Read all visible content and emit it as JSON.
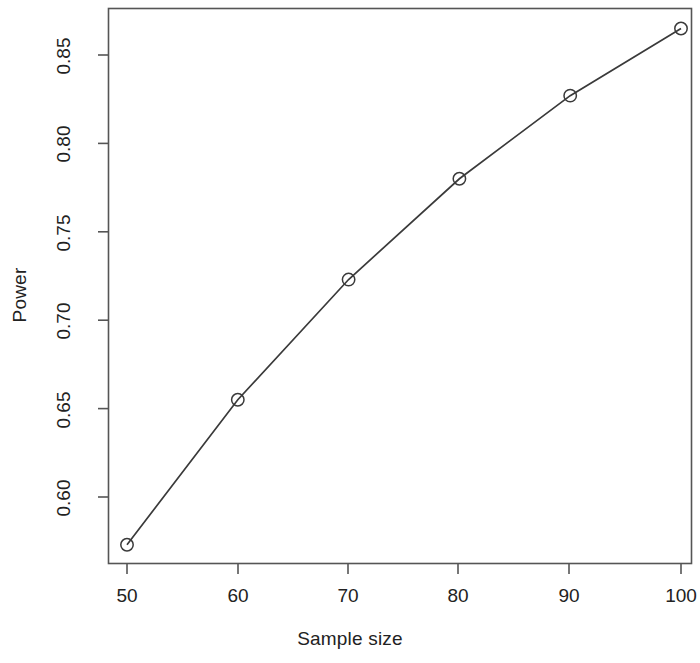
{
  "chart_data": {
    "type": "line",
    "title": "",
    "subtitle": "",
    "xlabel": "Sample size",
    "ylabel": "Power",
    "x": [
      50,
      60,
      70,
      80,
      90,
      100
    ],
    "values": [
      0.573,
      0.655,
      0.723,
      0.78,
      0.827,
      0.865
    ],
    "series": [
      {
        "name": "Power",
        "x": [
          50,
          60,
          70,
          80,
          90,
          100
        ],
        "values": [
          0.573,
          0.655,
          0.723,
          0.78,
          0.827,
          0.865
        ]
      }
    ],
    "xticks": [
      50,
      60,
      70,
      80,
      90,
      100
    ],
    "xtick_labels": [
      "50",
      "60",
      "70",
      "80",
      "90",
      "100"
    ],
    "yticks": [
      0.6,
      0.65,
      0.7,
      0.75,
      0.8,
      0.85
    ],
    "ytick_labels": [
      "0.60",
      "0.65",
      "0.70",
      "0.75",
      "0.80",
      "0.85"
    ],
    "xlim": [
      46,
      104
    ],
    "ylim": [
      0.565,
      0.874
    ],
    "grid": false,
    "legend": null,
    "legend_position": "none",
    "marker": "open-circle",
    "line_color": "#3a3a3a",
    "marker_color": "#3a3a3a",
    "background_color": "#ffffff",
    "axis_color": "#555555",
    "annotations": []
  },
  "axes": {
    "x_title": "Sample size",
    "y_title": "Power"
  }
}
